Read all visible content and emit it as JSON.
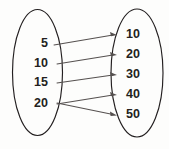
{
  "diagram": {
    "type": "mapping-diagram",
    "colors": {
      "background": "#fdfdfc",
      "ellipse_stroke": "#231f20",
      "arrow_stroke": "#55504f",
      "label_text": "#231f20"
    },
    "domain_set": {
      "name": "left-set",
      "ellipse": {
        "cx": 37.5,
        "cy": 72.5,
        "rx": 25,
        "ry": 63
      },
      "items": [
        {
          "value": "5",
          "x": 48,
          "y": 44
        },
        {
          "value": "10",
          "x": 48,
          "y": 63.5
        },
        {
          "value": "15",
          "x": 48,
          "y": 83
        },
        {
          "value": "20",
          "x": 48,
          "y": 104
        }
      ]
    },
    "codomain_set": {
      "name": "right-set",
      "ellipse": {
        "cx": 137,
        "cy": 73,
        "rx": 26,
        "ry": 64
      },
      "items": [
        {
          "value": "10",
          "x": 126,
          "y": 35
        },
        {
          "value": "20",
          "x": 126,
          "y": 55
        },
        {
          "value": "30",
          "x": 126,
          "y": 75
        },
        {
          "value": "40",
          "x": 126,
          "y": 95
        },
        {
          "value": "50",
          "x": 126,
          "y": 115
        }
      ]
    },
    "mappings": [
      {
        "from": "5",
        "to": "10",
        "x1": 54,
        "y1": 45,
        "x2": 117,
        "y2": 35
      },
      {
        "from": "10",
        "to": "20",
        "x1": 57,
        "y1": 64,
        "x2": 117,
        "y2": 55
      },
      {
        "from": "15",
        "to": "30",
        "x1": 57,
        "y1": 83,
        "x2": 117,
        "y2": 75
      },
      {
        "from": "20",
        "to": "40",
        "x1": 57,
        "y1": 104,
        "x2": 117,
        "y2": 95
      },
      {
        "from": "20",
        "to": "50",
        "x1": 57,
        "y1": 103,
        "x2": 117,
        "y2": 115
      }
    ]
  }
}
